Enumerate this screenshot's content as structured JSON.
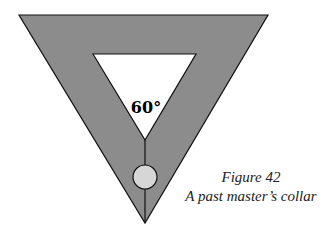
{
  "figure": {
    "angle_label": "60°",
    "caption_title": "Figure 42",
    "caption_text": "A past master’s collar"
  },
  "colors": {
    "collar_fill": "#8c8c8c",
    "outline": "#111111",
    "jewel_fill": "#d6d6d6",
    "background": "#ffffff"
  }
}
